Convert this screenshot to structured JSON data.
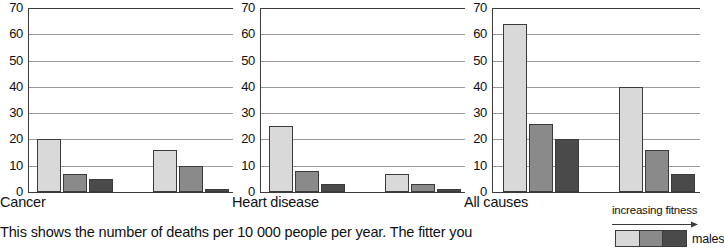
{
  "chart_data": [
    {
      "type": "bar",
      "title": "Cancer",
      "xlabel": "",
      "ylabel": "",
      "ylim": [
        0,
        70
      ],
      "yticks": [
        0,
        10,
        20,
        30,
        40,
        50,
        60,
        70
      ],
      "grid": true,
      "categories": [
        "males",
        "females"
      ],
      "series": [
        {
          "name": "low fitness",
          "color": "#d9d9d9",
          "values": [
            20,
            16
          ]
        },
        {
          "name": "medium fitness",
          "color": "#8a8a8a",
          "values": [
            7,
            10
          ]
        },
        {
          "name": "high fitness",
          "color": "#4a4a4a",
          "values": [
            5,
            1
          ]
        }
      ],
      "bars": [
        {
          "value": 20,
          "color": "#d9d9d9"
        },
        {
          "value": 7,
          "color": "#8a8a8a"
        },
        {
          "value": 5,
          "color": "#4a4a4a"
        },
        {
          "value": 16,
          "color": "#d9d9d9"
        },
        {
          "value": 10,
          "color": "#8a8a8a"
        },
        {
          "value": 1,
          "color": "#4a4a4a"
        }
      ]
    },
    {
      "type": "bar",
      "title": "Heart disease",
      "xlabel": "",
      "ylabel": "",
      "ylim": [
        0,
        70
      ],
      "yticks": [
        0,
        10,
        20,
        30,
        40,
        50,
        60,
        70
      ],
      "grid": true,
      "categories": [
        "males",
        "females"
      ],
      "series": [
        {
          "name": "low fitness",
          "color": "#d9d9d9",
          "values": [
            25,
            7
          ]
        },
        {
          "name": "medium fitness",
          "color": "#8a8a8a",
          "values": [
            8,
            3
          ]
        },
        {
          "name": "high fitness",
          "color": "#4a4a4a",
          "values": [
            3,
            1
          ]
        }
      ],
      "bars": [
        {
          "value": 25,
          "color": "#d9d9d9"
        },
        {
          "value": 8,
          "color": "#8a8a8a"
        },
        {
          "value": 3,
          "color": "#4a4a4a"
        },
        {
          "value": 7,
          "color": "#d9d9d9"
        },
        {
          "value": 3,
          "color": "#8a8a8a"
        },
        {
          "value": 1,
          "color": "#4a4a4a"
        }
      ]
    },
    {
      "type": "bar",
      "title": "All causes",
      "xlabel": "",
      "ylabel": "",
      "ylim": [
        0,
        70
      ],
      "yticks": [
        0,
        10,
        20,
        30,
        40,
        50,
        60,
        70
      ],
      "grid": true,
      "categories": [
        "males",
        "females"
      ],
      "series": [
        {
          "name": "low fitness",
          "color": "#d9d9d9",
          "values": [
            64,
            40
          ]
        },
        {
          "name": "medium fitness",
          "color": "#8a8a8a",
          "values": [
            26,
            16
          ]
        },
        {
          "name": "high fitness",
          "color": "#4a4a4a",
          "values": [
            20,
            7
          ]
        }
      ],
      "bars": [
        {
          "value": 64,
          "color": "#d9d9d9"
        },
        {
          "value": 26,
          "color": "#8a8a8a"
        },
        {
          "value": 20,
          "color": "#4a4a4a"
        },
        {
          "value": 40,
          "color": "#d9d9d9"
        },
        {
          "value": 16,
          "color": "#8a8a8a"
        },
        {
          "value": 7,
          "color": "#4a4a4a"
        }
      ]
    }
  ],
  "charts": [
    {
      "title": "Cancer"
    },
    {
      "title": "Heart disease"
    },
    {
      "title": "All causes"
    }
  ],
  "caption": {
    "text": "This shows the number of deaths per 10 000 people per year. The fitter you"
  },
  "legend": {
    "title": "increasing fitness",
    "arrow_icon": "right-arrow-icon",
    "label": "males",
    "swatches": [
      "#d9d9d9",
      "#8a8a8a",
      "#4a4a4a"
    ]
  },
  "colors": {
    "light": "#d9d9d9",
    "medium": "#8a8a8a",
    "dark": "#4a4a4a",
    "axis": "#3b3b3b",
    "grid": "#9a9a9a"
  }
}
